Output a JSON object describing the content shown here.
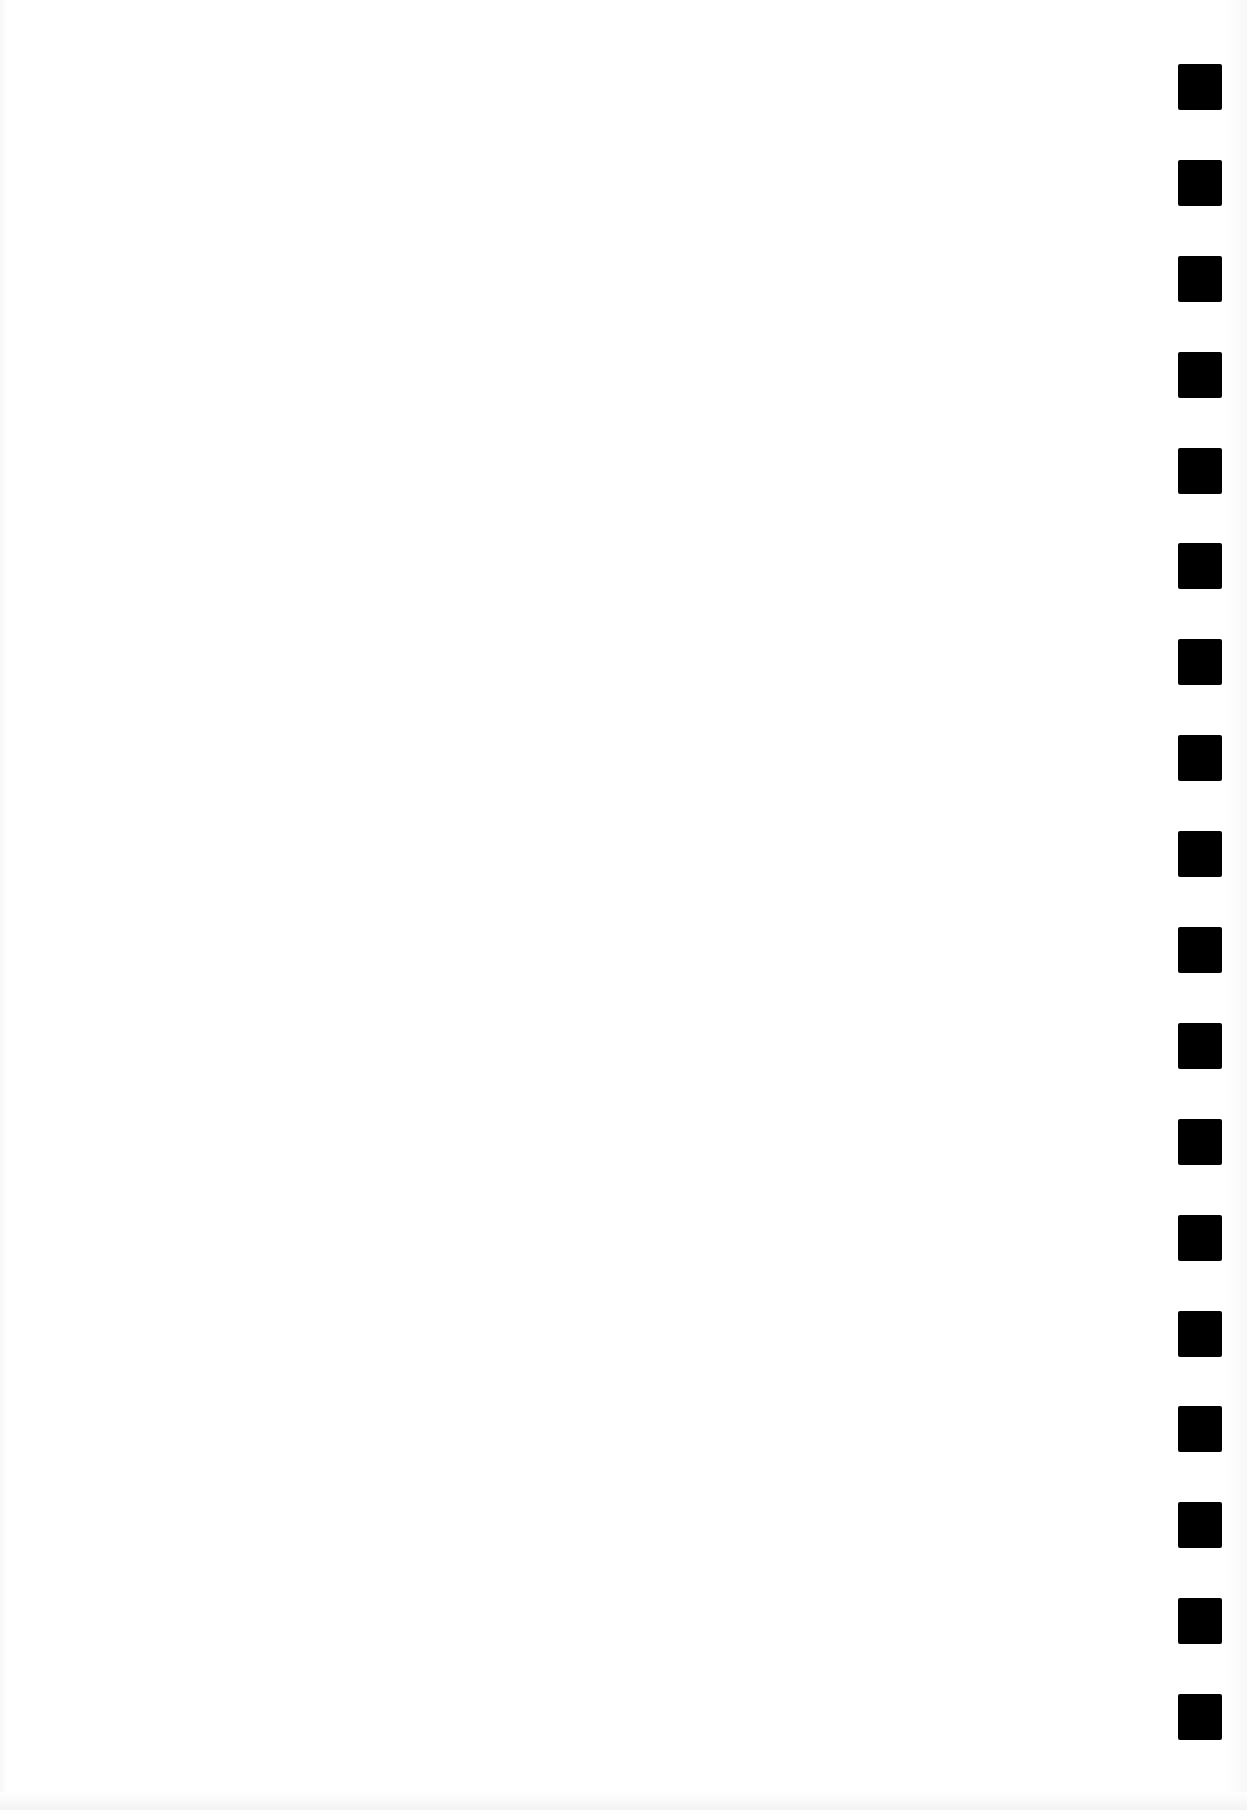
{
  "page": {
    "type": "blank scanned sheet",
    "background_color": "#ffffff"
  },
  "timing_marks": {
    "count": 18,
    "color": "#000000",
    "position": "right edge",
    "items": [
      {
        "index": 1
      },
      {
        "index": 2
      },
      {
        "index": 3
      },
      {
        "index": 4
      },
      {
        "index": 5
      },
      {
        "index": 6
      },
      {
        "index": 7
      },
      {
        "index": 8
      },
      {
        "index": 9
      },
      {
        "index": 10
      },
      {
        "index": 11
      },
      {
        "index": 12
      },
      {
        "index": 13
      },
      {
        "index": 14
      },
      {
        "index": 15
      },
      {
        "index": 16
      },
      {
        "index": 17
      },
      {
        "index": 18
      }
    ]
  }
}
